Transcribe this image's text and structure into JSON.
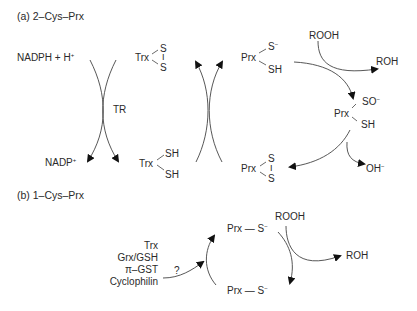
{
  "panel_a": {
    "title": "(a) 2–Cys–Prx",
    "nadph": "NADPH + H",
    "nadph_sup": "+",
    "nadp": "NADP",
    "nadp_sup": "+",
    "enzyme": "TR",
    "trx_ox": {
      "label": "Trx",
      "s1": "S",
      "bond": "I",
      "s2": "S"
    },
    "trx_red": {
      "label": "Trx",
      "sh1": "SH",
      "sh2": "SH"
    },
    "prx_thiolate": {
      "label": "Prx",
      "s": "S",
      "s_sup": "−",
      "sh": "SH"
    },
    "rooh": "ROOH",
    "roh": "ROH",
    "prx_sulfenic": {
      "label": "Prx",
      "so": "SO",
      "so_sup": "−",
      "sh": "SH"
    },
    "prx_disulfide": {
      "label": "Prx",
      "s1": "S",
      "bond": "I",
      "s2": "S"
    },
    "oh": "OH",
    "oh_sup": "−"
  },
  "panel_b": {
    "title": "(b) 1–Cys–Prx",
    "reductants": [
      "Trx",
      "Grx/GSH",
      "π–GST",
      "Cyclophilin"
    ],
    "question": "?",
    "prx_top": {
      "label": "Prx — S",
      "sup": "−"
    },
    "prx_bottom": {
      "label": "Prx — S",
      "sup": "−"
    },
    "rooh": "ROOH",
    "roh": "ROH"
  },
  "colors": {
    "line": "#333333",
    "text": "#2a2a2a",
    "background": "#ffffff"
  }
}
